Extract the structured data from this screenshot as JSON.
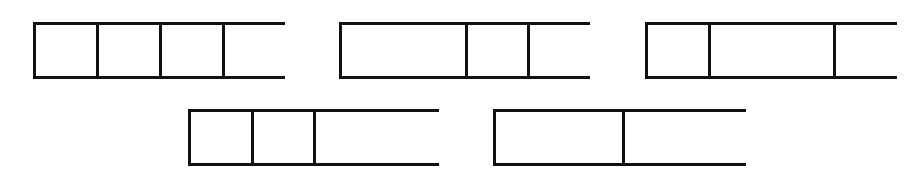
{
  "figure": {
    "background_color": "#ffffff",
    "stroke_color": "#111111",
    "fill_color": "#ffffff",
    "stroke_width_px": 3,
    "canvas": {
      "width": 921,
      "height": 184
    },
    "unit_length_px": 63,
    "bar_height_px": 57,
    "rows": [
      {
        "name": "top-row",
        "y": 22,
        "bar_indices": [
          0,
          1,
          2
        ]
      },
      {
        "name": "bottom-row",
        "y": 109,
        "bar_indices": [
          3,
          4
        ]
      }
    ]
  },
  "bars": [
    {
      "id": "bar-1",
      "label": "Bar 1",
      "row": "top-row",
      "x": 33,
      "y": 22,
      "width": 252,
      "height": 57,
      "segment_count": 4,
      "segment_units": [
        1,
        1,
        1,
        1
      ],
      "segment_widths_px": [
        63,
        63,
        63,
        63
      ],
      "fractions": [
        "1/4",
        "1/4",
        "1/4",
        "1/4"
      ],
      "divider_positions_px": [
        96,
        159,
        222
      ]
    },
    {
      "id": "bar-2",
      "label": "Bar 2",
      "row": "top-row",
      "x": 339,
      "y": 22,
      "width": 251,
      "height": 57,
      "segment_count": 3,
      "segment_units": [
        2,
        1,
        1
      ],
      "segment_widths_px": [
        126,
        62,
        63
      ],
      "fractions": [
        "1/2",
        "1/4",
        "1/4"
      ],
      "divider_positions_px": [
        465,
        527
      ]
    },
    {
      "id": "bar-3",
      "label": "Bar 3",
      "row": "top-row",
      "x": 645,
      "y": 22,
      "width": 252,
      "height": 57,
      "segment_count": 3,
      "segment_units": [
        1,
        2,
        1
      ],
      "segment_widths_px": [
        63,
        125,
        64
      ],
      "fractions": [
        "1/4",
        "1/2",
        "1/4"
      ],
      "divider_positions_px": [
        708,
        833
      ]
    },
    {
      "id": "bar-4",
      "label": "Bar 4",
      "row": "bottom-row",
      "x": 188,
      "y": 109,
      "width": 251,
      "height": 57,
      "segment_count": 3,
      "segment_units": [
        1,
        1,
        2
      ],
      "segment_widths_px": [
        63,
        62,
        126
      ],
      "fractions": [
        "1/4",
        "1/4",
        "1/2"
      ],
      "divider_positions_px": [
        251,
        313
      ]
    },
    {
      "id": "bar-5",
      "label": "Bar 5",
      "row": "bottom-row",
      "x": 493,
      "y": 109,
      "width": 253,
      "height": 57,
      "segment_count": 2,
      "segment_units": [
        2,
        2
      ],
      "segment_widths_px": [
        129,
        124
      ],
      "fractions": [
        "1/2",
        "1/2"
      ],
      "divider_positions_px": [
        622
      ]
    }
  ]
}
